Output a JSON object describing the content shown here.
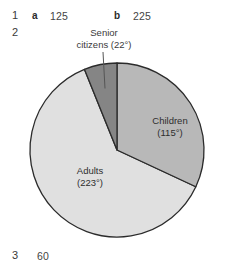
{
  "answers": {
    "row1": {
      "number": "1",
      "part_a_letter": "a",
      "part_a_value": "125",
      "part_b_letter": "b",
      "part_b_value": "225"
    },
    "row2": {
      "number": "2"
    },
    "row3": {
      "number": "3",
      "value": "60"
    }
  },
  "callout": {
    "line1": "Senior",
    "line2": "citizens (22°)"
  },
  "chart_data": {
    "type": "pie",
    "title": "",
    "total_degrees": 360,
    "units": "degrees",
    "legend_position": "inside-slices",
    "center": {
      "x": 117,
      "y": 150
    },
    "radius": 87,
    "start_angle_deg": 0,
    "direction": "clockwise",
    "slices": [
      {
        "name": "Children",
        "label_line1": "Children",
        "label_line2": "(115°)",
        "value": 115,
        "color": "#b8b8b8",
        "label_x": 170,
        "label_y": 126,
        "label_placement": "inside"
      },
      {
        "name": "Adults",
        "label_line1": "Adults",
        "label_line2": "(223°)",
        "value": 223,
        "color": "#e0e0e0",
        "label_x": 90,
        "label_y": 176,
        "label_placement": "inside"
      },
      {
        "name": "Senior citizens",
        "label_line1": "Senior",
        "label_line2": "citizens (22°)",
        "value": 22,
        "color": "#858585",
        "label_x": 104,
        "label_y": 30,
        "label_placement": "callout"
      }
    ],
    "stroke_color": "#2b2b2b"
  },
  "colors": {
    "outline": "#2b2b2b",
    "leader_line": "#555555",
    "text": "#333333",
    "background": "#ffffff"
  }
}
